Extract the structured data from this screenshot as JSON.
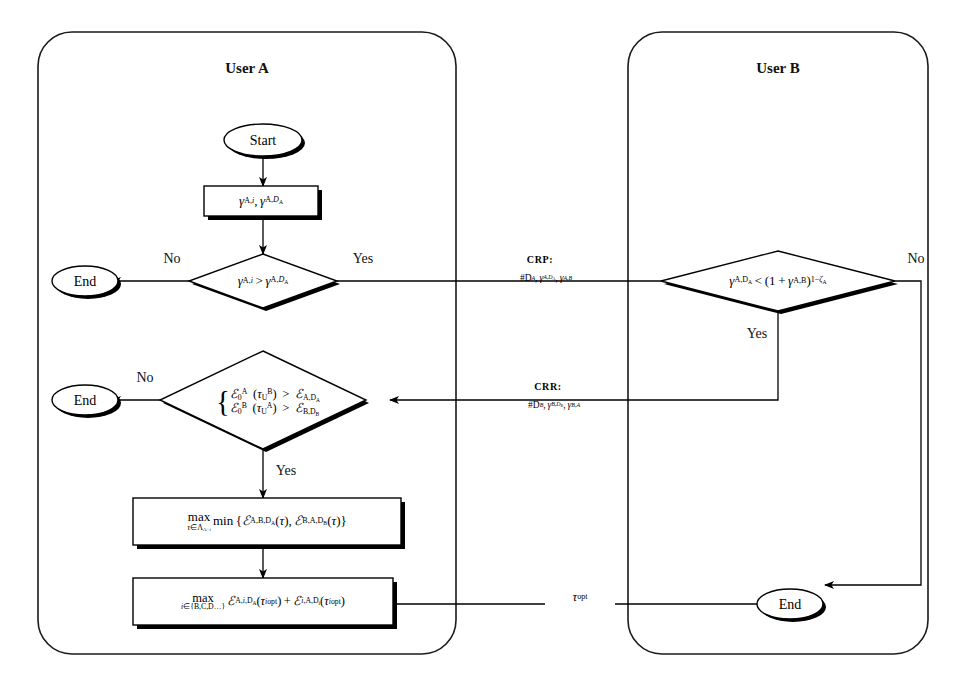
{
  "figure": {
    "type": "flowchart",
    "lanes": [
      {
        "id": "user_a",
        "title": "User A"
      },
      {
        "id": "user_b",
        "title": "User B"
      }
    ]
  },
  "user_a": {
    "title": "User A",
    "start": "Start",
    "end_1": "End",
    "end_2": "End",
    "process_params": {
      "text": "γ_{A,i}, γ_{A,D_A}",
      "parts": [
        "γ",
        "A,i",
        "γ",
        "A,D",
        "A"
      ]
    },
    "decision_1": {
      "text": "γ_{A,i} > γ_{A,D_A}",
      "yes_label": "Yes",
      "no_label": "No"
    },
    "decision_2": {
      "line1": "I_0^A (τ_U^B) > I_{A,D_A}",
      "line2": "I_0^B (τ_U^A) > I_{B,D_B}",
      "yes_label": "Yes",
      "no_label": "No"
    },
    "process_maxmin": {
      "text": "max_{τ∈Λ_{A+i}} min { I_{A,B,D_A}(τ), I_{B,A,D_B}(τ) }",
      "op1": "max",
      "limit1": "τ∈Λ_{A+i}",
      "op2": "min"
    },
    "process_maxsum": {
      "text": "max_{i∈{B,C,D...}} I_{A,i,D_A}(τ^i_opt) + I_{i,A,D_i}(τ^i_opt)",
      "op1": "max",
      "limit1": "i∈{B,C,D...}"
    }
  },
  "user_b": {
    "title": "User B",
    "end": "End",
    "decision": {
      "text": "γ_{A,D_A} < (1 + γ_{A,B})^{1-ζ_A}",
      "yes_label": "Yes",
      "no_label": "No"
    }
  },
  "messages": [
    {
      "id": "crp",
      "title": "CRP:",
      "payload": "#D_A, γ_{A,D_A}, γ_{A,B}",
      "direction": "a-to-b"
    },
    {
      "id": "crr",
      "title": "CRR:",
      "payload": "#D_B, γ_{B,D_B}, γ_{B,A}",
      "direction": "b-to-a"
    }
  ],
  "edge_labels": {
    "tau_opt": "τ_opt"
  },
  "colors": {
    "ink": "#000000",
    "paper": "#ffffff",
    "lane_border": "#1a1a1a"
  }
}
